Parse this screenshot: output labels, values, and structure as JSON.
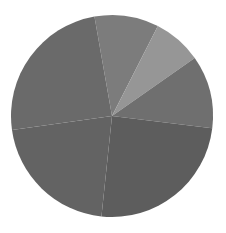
{
  "figure": {
    "background_color": "#ffffff",
    "width": 226,
    "height": 233
  },
  "chart_data": {
    "type": "pie",
    "title": "",
    "subtitle": "",
    "xlabel": "",
    "ylabel": "",
    "grid": false,
    "legend": "none",
    "labels_shown": false,
    "center_x": 112,
    "center_y": 116,
    "radius": 101,
    "start_angle_deg": 350,
    "direction": "clockwise",
    "categories": [
      "Slice 1",
      "Slice 2",
      "Slice 3",
      "Slice 4",
      "Slice 5",
      "Slice 6"
    ],
    "values": [
      10.3,
      7.8,
      11.7,
      24.7,
      21.1,
      24.4
    ],
    "angles_deg": [
      37,
      28,
      42,
      89,
      76,
      88
    ],
    "colors": [
      "#7c7c7c",
      "#969696",
      "#6f6f6f",
      "#5d5d5d",
      "#636363",
      "#6a6a6a"
    ],
    "slices": [
      {
        "name": "Slice 1",
        "value": 10.3,
        "angle_deg": 37,
        "start_deg": 350,
        "end_deg": 27,
        "color": "#7c7c7c"
      },
      {
        "name": "Slice 2",
        "value": 7.8,
        "angle_deg": 28,
        "start_deg": 27,
        "end_deg": 55,
        "color": "#969696"
      },
      {
        "name": "Slice 3",
        "value": 11.7,
        "angle_deg": 42,
        "start_deg": 55,
        "end_deg": 97,
        "color": "#6f6f6f"
      },
      {
        "name": "Slice 4",
        "value": 24.7,
        "angle_deg": 89,
        "start_deg": 97,
        "end_deg": 186,
        "color": "#5d5d5d"
      },
      {
        "name": "Slice 5",
        "value": 21.1,
        "angle_deg": 76,
        "start_deg": 186,
        "end_deg": 262,
        "color": "#636363"
      },
      {
        "name": "Slice 6",
        "value": 24.4,
        "angle_deg": 88,
        "start_deg": 262,
        "end_deg": 350,
        "color": "#6a6a6a"
      }
    ]
  }
}
